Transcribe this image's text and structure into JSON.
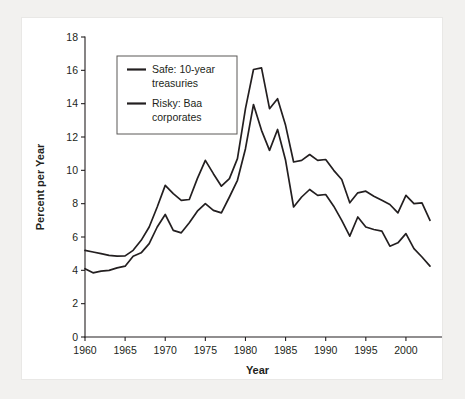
{
  "chart_data": {
    "type": "line",
    "title": "",
    "xlabel": "Year",
    "ylabel": "Percent per Year",
    "xlim": [
      1960,
      2003
    ],
    "ylim": [
      0,
      18
    ],
    "grid": false,
    "legend_position": "top-left",
    "x_ticks": [
      "1960",
      "1965",
      "1970",
      "1975",
      "1980",
      "1985",
      "1990",
      "1995",
      "2000"
    ],
    "x_tick_values": [
      1960,
      1965,
      1970,
      1975,
      1980,
      1985,
      1990,
      1995,
      2000
    ],
    "y_ticks": [
      "0",
      "2",
      "4",
      "6",
      "8",
      "10",
      "12",
      "14",
      "16",
      "18"
    ],
    "y_tick_values": [
      0,
      2,
      4,
      6,
      8,
      10,
      12,
      14,
      16,
      18
    ],
    "x": [
      1960,
      1961,
      1962,
      1963,
      1964,
      1965,
      1966,
      1967,
      1968,
      1969,
      1970,
      1971,
      1972,
      1973,
      1974,
      1975,
      1976,
      1977,
      1978,
      1979,
      1980,
      1981,
      1982,
      1983,
      1984,
      1985,
      1986,
      1987,
      1988,
      1989,
      1990,
      1991,
      1992,
      1993,
      1994,
      1995,
      1996,
      1997,
      1998,
      1999,
      2000,
      2001,
      2002,
      2003
    ],
    "series": [
      {
        "name": "Risky: Baa corporates",
        "color": "#231f20",
        "values": [
          5.2,
          5.1,
          5.0,
          4.9,
          4.85,
          4.87,
          5.2,
          5.8,
          6.6,
          7.8,
          9.1,
          8.6,
          8.2,
          8.25,
          9.5,
          10.6,
          9.8,
          9.05,
          9.5,
          10.7,
          13.7,
          16.05,
          16.15,
          13.7,
          14.3,
          12.7,
          10.5,
          10.6,
          10.95,
          10.6,
          10.65,
          10.0,
          9.45,
          8.05,
          8.65,
          8.75,
          8.45,
          8.2,
          7.95,
          7.45,
          8.5,
          8.0,
          8.05,
          7.0
        ]
      },
      {
        "name": "Safe: 10-year treasuries",
        "color": "#231f20",
        "values": [
          4.1,
          3.85,
          3.95,
          4.0,
          4.15,
          4.25,
          4.85,
          5.05,
          5.6,
          6.6,
          7.35,
          6.4,
          6.25,
          6.85,
          7.55,
          8.0,
          7.6,
          7.45,
          8.4,
          9.4,
          11.3,
          13.95,
          12.4,
          11.2,
          12.45,
          10.6,
          7.8,
          8.4,
          8.85,
          8.5,
          8.55,
          7.85,
          7.0,
          6.05,
          7.2,
          6.6,
          6.45,
          6.35,
          5.45,
          5.65,
          6.2,
          5.3,
          4.8,
          4.25
        ]
      }
    ],
    "legend": [
      {
        "label_line1": "Safe: 10-year",
        "label_line2": "treasuries"
      },
      {
        "label_line1": "Risky: Baa",
        "label_line2": "corporates"
      }
    ]
  },
  "geometry": {
    "plot_left": 63,
    "plot_right": 408,
    "plot_top": 19,
    "plot_bottom": 319
  }
}
